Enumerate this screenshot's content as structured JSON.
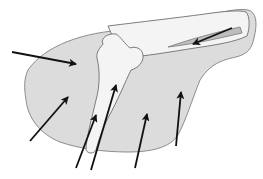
{
  "figure": {
    "type": "anatomical-diagram",
    "width": 263,
    "height": 179,
    "colors": {
      "background": "#ffffff",
      "soft_tissue_fill": "#dcdcdc",
      "soft_tissue_stroke": "#8c8c8c",
      "bone_fill": "#f4f4f4",
      "bone_stroke": "#6e6e6e",
      "canal_fill": "#bdbdbd",
      "arrow": "#111111"
    },
    "arrows": [
      {
        "id": "arrow-1",
        "x1": 12,
        "y1": 52,
        "x2": 76,
        "y2": 64
      },
      {
        "id": "arrow-2",
        "x1": 232,
        "y1": 28,
        "x2": 193,
        "y2": 44
      },
      {
        "id": "arrow-3",
        "x1": 30,
        "y1": 141,
        "x2": 68,
        "y2": 97
      },
      {
        "id": "arrow-4",
        "x1": 76,
        "y1": 168,
        "x2": 96,
        "y2": 115
      },
      {
        "id": "arrow-5",
        "x1": 91,
        "y1": 170,
        "x2": 116,
        "y2": 85
      },
      {
        "id": "arrow-6",
        "x1": 135,
        "y1": 168,
        "x2": 147,
        "y2": 114
      },
      {
        "id": "arrow-7",
        "x1": 176,
        "y1": 146,
        "x2": 181,
        "y2": 92
      }
    ],
    "labels": []
  }
}
